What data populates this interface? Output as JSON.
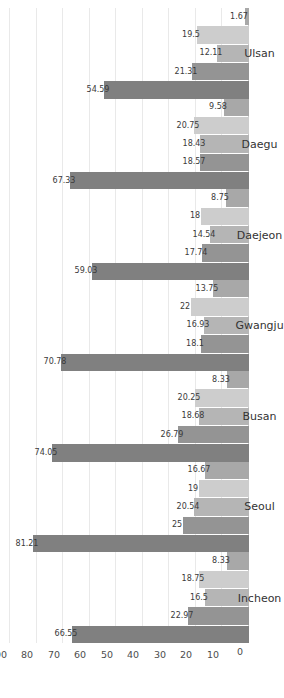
{
  "chart_data": {
    "type": "bar",
    "orientation": "vertical-rotated",
    "title": "",
    "subtitle": "",
    "xlabel": "",
    "ylabel": "",
    "ylim": [
      0,
      90
    ],
    "yticks": [
      0,
      10,
      20,
      30,
      40,
      50,
      60,
      70,
      80,
      90
    ],
    "ytick_labels": [
      "0",
      "10",
      "20",
      "30",
      "40",
      "50",
      "60",
      "70",
      "80",
      "90"
    ],
    "grid": true,
    "legend": "none",
    "categories": [
      "Incheon",
      "Seoul",
      "Busan",
      "Gwangju",
      "Daejeon",
      "Daegu",
      "Ulsan"
    ],
    "series": [
      {
        "name": "series-1",
        "color": "#808080",
        "values": [
          66.55,
          81.21,
          74.05,
          70.78,
          59.03,
          67.33,
          54.59
        ],
        "labels": [
          "66.55",
          "81.21",
          "74.05",
          "70.78",
          "59.03",
          "67.33",
          "54.59"
        ]
      },
      {
        "name": "series-2",
        "color": "#949494",
        "values": [
          22.97,
          25,
          26.79,
          18.1,
          17.74,
          18.57,
          21.31
        ],
        "labels": [
          "22.97",
          "25",
          "26.79",
          "18.1",
          "17.74",
          "18.57",
          "21.31"
        ]
      },
      {
        "name": "series-3",
        "color": "#b5b5b5",
        "values": [
          16.5,
          20.54,
          18.68,
          16.93,
          14.54,
          18.43,
          12.11
        ],
        "labels": [
          "16.5",
          "20.54",
          "18.68",
          "16.93",
          "14.54",
          "18.43",
          "12.11"
        ]
      },
      {
        "name": "series-4",
        "color": "#cdcdcd",
        "values": [
          18.75,
          19,
          20.25,
          22,
          18,
          20.75,
          19.5
        ],
        "labels": [
          "18.75",
          "19",
          "20.25",
          "22",
          "18",
          "20.75",
          "19.5"
        ]
      },
      {
        "name": "series-5",
        "color": "#a8a8a8",
        "values": [
          8.33,
          16.67,
          8.33,
          13.75,
          8.75,
          9.58,
          1.67
        ],
        "labels": [
          "8.33",
          "16.67",
          "8.33",
          "13.75",
          "8.75",
          "9.58",
          "1.67"
        ]
      }
    ]
  }
}
